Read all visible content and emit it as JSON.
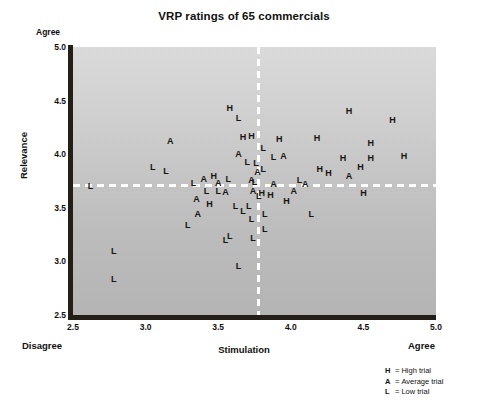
{
  "chart_data": {
    "type": "scatter",
    "title": "VRP ratings of 65 commercials",
    "xlabel": "Stimulation",
    "ylabel": "Relevance",
    "xlim": [
      2.5,
      5.0
    ],
    "ylim": [
      2.5,
      5.0
    ],
    "xticks": [
      "2.5",
      "3.0",
      "3.5",
      "4.0",
      "4.5",
      "5.0"
    ],
    "yticks": [
      "2.5",
      "3.0",
      "3.5",
      "4.0",
      "4.5",
      "5.0"
    ],
    "grid": false,
    "legend_position": "bottom-right",
    "x_low_anchor": "Disagree",
    "x_high_anchor": "Agree",
    "y_high_anchor": "Agree",
    "reference_lines": {
      "x": 3.77,
      "y": 3.72
    },
    "legend": [
      {
        "key": "H",
        "sep": "=",
        "label": "High trial"
      },
      {
        "key": "A",
        "sep": "=",
        "label": "Average trial"
      },
      {
        "key": "L",
        "sep": "=",
        "label": "Low trial"
      }
    ],
    "series": [
      {
        "name": "High trial",
        "marker": "H"
      },
      {
        "name": "Average trial",
        "marker": "A"
      },
      {
        "name": "Low trial",
        "marker": "L"
      }
    ],
    "points": [
      {
        "label": "H",
        "x": 3.58,
        "y": 4.43
      },
      {
        "label": "L",
        "x": 3.64,
        "y": 4.34
      },
      {
        "label": "A",
        "x": 3.17,
        "y": 4.12
      },
      {
        "label": "H",
        "x": 3.67,
        "y": 4.16
      },
      {
        "label": "A",
        "x": 3.64,
        "y": 4.0
      },
      {
        "label": "L",
        "x": 3.7,
        "y": 3.93
      },
      {
        "label": "L",
        "x": 3.05,
        "y": 3.88
      },
      {
        "label": "L",
        "x": 3.14,
        "y": 3.84
      },
      {
        "label": "A",
        "x": 3.4,
        "y": 3.77
      },
      {
        "label": "H",
        "x": 3.47,
        "y": 3.8
      },
      {
        "label": "L",
        "x": 3.57,
        "y": 3.77
      },
      {
        "label": "A",
        "x": 3.73,
        "y": 3.76
      },
      {
        "label": "L",
        "x": 2.62,
        "y": 3.7
      },
      {
        "label": "L",
        "x": 3.42,
        "y": 3.66
      },
      {
        "label": "A",
        "x": 3.55,
        "y": 3.65
      },
      {
        "label": "H",
        "x": 3.44,
        "y": 3.54
      },
      {
        "label": "L",
        "x": 3.62,
        "y": 3.52
      },
      {
        "label": "L",
        "x": 3.67,
        "y": 3.47
      },
      {
        "label": "A",
        "x": 3.36,
        "y": 3.44
      },
      {
        "label": "L",
        "x": 3.29,
        "y": 3.34
      },
      {
        "label": "L",
        "x": 3.55,
        "y": 3.2
      },
      {
        "label": "L",
        "x": 3.58,
        "y": 3.24
      },
      {
        "label": "L",
        "x": 2.78,
        "y": 3.1
      },
      {
        "label": "L",
        "x": 3.64,
        "y": 2.96
      },
      {
        "label": "L",
        "x": 2.78,
        "y": 2.84
      },
      {
        "label": "H",
        "x": 4.4,
        "y": 4.4
      },
      {
        "label": "H",
        "x": 4.7,
        "y": 4.32
      },
      {
        "label": "H",
        "x": 3.92,
        "y": 4.14
      },
      {
        "label": "H",
        "x": 4.18,
        "y": 4.15
      },
      {
        "label": "H",
        "x": 4.55,
        "y": 4.1
      },
      {
        "label": "L",
        "x": 3.81,
        "y": 4.06
      },
      {
        "label": "H",
        "x": 4.78,
        "y": 3.98
      },
      {
        "label": "L",
        "x": 3.88,
        "y": 3.97
      },
      {
        "label": "A",
        "x": 3.95,
        "y": 3.98
      },
      {
        "label": "H",
        "x": 4.36,
        "y": 3.96
      },
      {
        "label": "H",
        "x": 4.55,
        "y": 3.96
      },
      {
        "label": "L",
        "x": 3.81,
        "y": 3.86
      },
      {
        "label": "H",
        "x": 4.48,
        "y": 3.88
      },
      {
        "label": "H",
        "x": 4.2,
        "y": 3.86
      },
      {
        "label": "H",
        "x": 4.26,
        "y": 3.82
      },
      {
        "label": "A",
        "x": 4.4,
        "y": 3.8
      },
      {
        "label": "A",
        "x": 3.88,
        "y": 3.72
      },
      {
        "label": "L",
        "x": 4.06,
        "y": 3.76
      },
      {
        "label": "A",
        "x": 4.1,
        "y": 3.72
      },
      {
        "label": "A",
        "x": 4.02,
        "y": 3.66
      },
      {
        "label": "H",
        "x": 3.86,
        "y": 3.62
      },
      {
        "label": "H",
        "x": 4.5,
        "y": 3.64
      },
      {
        "label": "H",
        "x": 3.97,
        "y": 3.56
      },
      {
        "label": "L",
        "x": 3.82,
        "y": 3.44
      },
      {
        "label": "L",
        "x": 4.14,
        "y": 3.44
      },
      {
        "label": "L",
        "x": 3.82,
        "y": 3.3
      },
      {
        "label": "L",
        "x": 3.78,
        "y": 3.61
      },
      {
        "label": "A",
        "x": 3.77,
        "y": 3.83
      },
      {
        "label": "L",
        "x": 3.76,
        "y": 3.92
      },
      {
        "label": "L",
        "x": 3.75,
        "y": 3.74
      },
      {
        "label": "A",
        "x": 3.74,
        "y": 3.66
      },
      {
        "label": "H",
        "x": 3.8,
        "y": 3.64
      },
      {
        "label": "L",
        "x": 3.73,
        "y": 3.4
      },
      {
        "label": "L",
        "x": 3.74,
        "y": 3.22
      },
      {
        "label": "H",
        "x": 3.73,
        "y": 4.17
      },
      {
        "label": "L",
        "x": 3.71,
        "y": 3.52
      },
      {
        "label": "A",
        "x": 3.5,
        "y": 3.73
      },
      {
        "label": "L",
        "x": 3.5,
        "y": 3.66
      },
      {
        "label": "L",
        "x": 3.33,
        "y": 3.73
      },
      {
        "label": "A",
        "x": 3.35,
        "y": 3.58
      }
    ]
  }
}
